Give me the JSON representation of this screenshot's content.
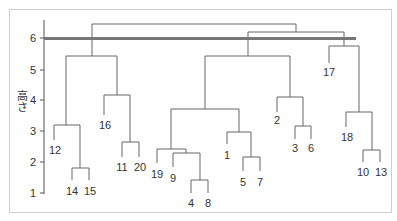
{
  "chart_data": {
    "type": "dendrogram",
    "title": "",
    "xlabel": "",
    "ylabel": "高さ",
    "ylim": [
      1,
      6.5
    ],
    "yticks": [
      1,
      2,
      3,
      4,
      5,
      6
    ],
    "cut_line": {
      "height": 5.95,
      "color": "#777777"
    },
    "leaves": [
      "12",
      "14",
      "15",
      "16",
      "11",
      "20",
      "19",
      "9",
      "4",
      "8",
      "1",
      "5",
      "7",
      "2",
      "3",
      "6",
      "17",
      "18",
      "10",
      "13"
    ],
    "merges": [
      {
        "left": "14",
        "right": "15",
        "height": 1.8
      },
      {
        "left": "12",
        "right": "(14,15)",
        "height": 3.2
      },
      {
        "left": "11",
        "right": "20",
        "height": 2.6
      },
      {
        "left": "16",
        "right": "(11,20)",
        "height": 4.15
      },
      {
        "left": "(12,14,15)",
        "right": "(16,11,20)",
        "height": 5.4
      },
      {
        "left": "4",
        "right": "8",
        "height": 1.45
      },
      {
        "left": "9",
        "right": "(4,8)",
        "height": 2.3
      },
      {
        "left": "19",
        "right": "(9,4,8)",
        "height": 2.4
      },
      {
        "left": "5",
        "right": "7",
        "height": 2.2
      },
      {
        "left": "1",
        "right": "(5,7)",
        "height": 3.0
      },
      {
        "left": "(19,9,4,8)",
        "right": "(1,5,7)",
        "height": 3.7
      },
      {
        "left": "3",
        "right": "6",
        "height": 3.15
      },
      {
        "left": "2",
        "right": "(3,6)",
        "height": 4.1
      },
      {
        "left": "(19,9,4,8,1,5,7)",
        "right": "(2,3,6)",
        "height": 5.4
      },
      {
        "left": "10",
        "right": "13",
        "height": 2.4
      },
      {
        "left": "18",
        "right": "(10,13)",
        "height": 3.6
      },
      {
        "left": "17",
        "right": "(18,10,13)",
        "height": 5.75
      },
      {
        "left": "(mid cluster)",
        "right": "(17,18,10,13)",
        "height": 6.2
      },
      {
        "left": "(left cluster)",
        "right": "(rest)",
        "height": 6.45
      }
    ],
    "grid": false,
    "legend": null
  },
  "axis": {
    "ylabel": "高さ",
    "ticks": [
      {
        "label": "6",
        "y": 38
      },
      {
        "label": "5",
        "y": 70
      },
      {
        "label": "4",
        "y": 100
      },
      {
        "label": "3",
        "y": 131
      },
      {
        "label": "2",
        "y": 162
      },
      {
        "label": "1",
        "y": 193
      }
    ]
  },
  "labels": [
    {
      "text": "12",
      "x": 55,
      "y": 154
    },
    {
      "text": "14",
      "x": 72,
      "y": 195
    },
    {
      "text": "15",
      "x": 90,
      "y": 195
    },
    {
      "text": "16",
      "x": 105,
      "y": 129
    },
    {
      "text": "11",
      "x": 122,
      "y": 171
    },
    {
      "text": "20",
      "x": 140,
      "y": 171
    },
    {
      "text": "19",
      "x": 157,
      "y": 178
    },
    {
      "text": "9",
      "x": 173,
      "y": 182
    },
    {
      "text": "4",
      "x": 191,
      "y": 207
    },
    {
      "text": "8",
      "x": 208,
      "y": 207
    },
    {
      "text": "1",
      "x": 227,
      "y": 159
    },
    {
      "text": "5",
      "x": 243,
      "y": 186
    },
    {
      "text": "7",
      "x": 260,
      "y": 186
    },
    {
      "text": "2",
      "x": 277,
      "y": 124
    },
    {
      "text": "3",
      "x": 295,
      "y": 152
    },
    {
      "text": "6",
      "x": 311,
      "y": 152
    },
    {
      "text": "17",
      "x": 329,
      "y": 76
    },
    {
      "text": "18",
      "x": 347,
      "y": 141
    },
    {
      "text": "10",
      "x": 363,
      "y": 176
    },
    {
      "text": "13",
      "x": 381,
      "y": 176
    }
  ]
}
